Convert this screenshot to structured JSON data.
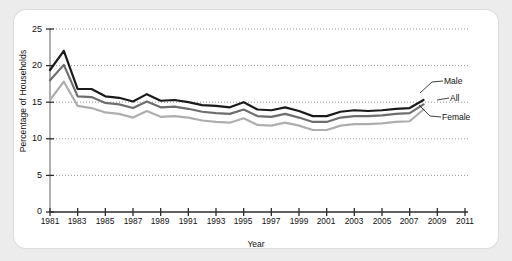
{
  "chart_data": {
    "type": "line",
    "title": "",
    "xlabel": "Year",
    "ylabel": "Percentage of Households",
    "xlim": [
      1981,
      2011
    ],
    "ylim": [
      0,
      25
    ],
    "grid": true,
    "grid_axis": "y",
    "legend_position": "right-inline",
    "x_tick_labels": [
      "1981",
      "1983",
      "1985",
      "1987",
      "1989",
      "1991",
      "1993",
      "1995",
      "1997",
      "1999",
      "2001",
      "2003",
      "2005",
      "2007",
      "2009",
      "2011"
    ],
    "y_tick_labels": [
      "0",
      "5",
      "10",
      "15",
      "20",
      "25"
    ],
    "x": [
      1981,
      1982,
      1983,
      1984,
      1985,
      1986,
      1987,
      1988,
      1989,
      1990,
      1991,
      1992,
      1993,
      1994,
      1995,
      1996,
      1997,
      1998,
      1999,
      2000,
      2001,
      2002,
      2003,
      2004,
      2005,
      2006,
      2007,
      2008
    ],
    "series": [
      {
        "name": "Male",
        "color": "#1a1a1a",
        "values": [
          19.4,
          22.0,
          16.8,
          16.8,
          15.8,
          15.6,
          15.1,
          16.1,
          15.2,
          15.3,
          15.0,
          14.6,
          14.5,
          14.3,
          15.0,
          14.0,
          13.9,
          14.3,
          13.8,
          13.1,
          13.1,
          13.7,
          13.9,
          13.8,
          13.9,
          14.1,
          14.2,
          15.3
        ]
      },
      {
        "name": "All",
        "color": "#6e6e6e",
        "values": [
          18.0,
          20.1,
          15.8,
          15.7,
          14.9,
          14.7,
          14.2,
          15.1,
          14.3,
          14.4,
          14.1,
          13.7,
          13.5,
          13.4,
          14.0,
          13.1,
          13.0,
          13.4,
          12.9,
          12.3,
          12.3,
          12.9,
          13.1,
          13.1,
          13.2,
          13.4,
          13.5,
          14.7
        ]
      },
      {
        "name": "Female",
        "color": "#aeaeae",
        "values": [
          15.3,
          17.8,
          14.5,
          14.2,
          13.6,
          13.4,
          12.9,
          13.8,
          13.0,
          13.1,
          12.9,
          12.5,
          12.3,
          12.2,
          12.8,
          11.9,
          11.8,
          12.2,
          11.8,
          11.2,
          11.2,
          11.8,
          12.0,
          12.0,
          12.1,
          12.3,
          12.4,
          14.0
        ]
      }
    ]
  },
  "labels": {
    "y_axis_title": "Percentage of Households",
    "x_axis_title": "Year",
    "series_male": "Male",
    "series_all": "All",
    "series_female": "Female",
    "y0": "0",
    "y5": "5",
    "y10": "10",
    "y15": "15",
    "y20": "20",
    "y25": "25",
    "x1981": "1981",
    "x1983": "1983",
    "x1985": "1985",
    "x1987": "1987",
    "x1989": "1989",
    "x1991": "1991",
    "x1993": "1993",
    "x1995": "1995",
    "x1997": "1997",
    "x1999": "1999",
    "x2001": "2001",
    "x2003": "2003",
    "x2005": "2005",
    "x2007": "2007",
    "x2009": "2009",
    "x2011": "2011"
  }
}
